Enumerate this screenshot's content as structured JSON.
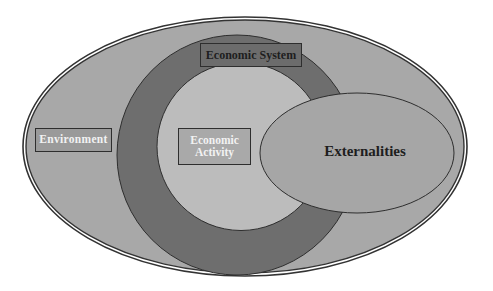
{
  "diagram": {
    "title": "",
    "nodes": [
      {
        "id": "environment",
        "label": "Environment",
        "shape": "ellipse",
        "role": "outermost container"
      },
      {
        "id": "economic_system",
        "label": "Economic System",
        "shape": "ring",
        "role": "inside environment"
      },
      {
        "id": "economic_activity",
        "label": "Economic Activity",
        "shape": "circle",
        "role": "inside economic system"
      },
      {
        "id": "externalities",
        "label": "Externalities",
        "shape": "ellipse",
        "role": "overlaps economic activity, economic system and environment"
      }
    ],
    "labels": {
      "economic_system": "Economic System",
      "environment": "Environment",
      "economic_activity_line1": "Economic",
      "economic_activity_line2": "Activity",
      "externalities": "Externalities"
    },
    "colors": {
      "environment_fill": "#a8a8a8",
      "economic_system_fill": "#6e6e6e",
      "economic_activity_fill": "#bcbcbc",
      "externalities_fill": "#a6a6a6",
      "stroke": "#2e2e2e",
      "background": "#ffffff"
    }
  }
}
